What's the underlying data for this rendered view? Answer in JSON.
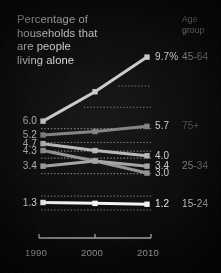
{
  "title_lines": [
    "Percentage of",
    "households that",
    "are people",
    "living alone"
  ],
  "header": {
    "age_group_line1": "Age",
    "age_group_line2": "group"
  },
  "axis": {
    "xticks": [
      "1990",
      "2000",
      "2010"
    ]
  },
  "chart_data": {
    "type": "line",
    "title": "Percentage of households that are people living alone",
    "xlabel": "",
    "ylabel": "",
    "x": [
      1990,
      2000,
      2010
    ],
    "xlim": [
      1990,
      2010
    ],
    "ylim": [
      0.0,
      10.4
    ],
    "grid": false,
    "legend_position": "right",
    "legend_title": "Age group",
    "series": [
      {
        "name": "45-64",
        "values": [
          6.0,
          7.7,
          9.7
        ],
        "start_label": "6.0",
        "end_label": "9.7%",
        "group_label": "45-64",
        "color": "#c8c8c8",
        "group_label_color": "#8a8a8a"
      },
      {
        "name": "75+",
        "values": [
          5.2,
          5.4,
          5.7
        ],
        "start_label": "5.2",
        "end_label": "5.7",
        "group_label": "75+",
        "color": "#7c7c7c",
        "group_label_color": "#585858"
      },
      {
        "name": "series-4.7",
        "values": [
          4.7,
          4.3,
          4.0
        ],
        "start_label": "4.7",
        "end_label": "4.0",
        "group_label": "",
        "color": "#b4b4b4",
        "group_label_color": "#585858"
      },
      {
        "name": "series-4.3",
        "values": [
          4.3,
          3.7,
          3.0
        ],
        "start_label": "4.3",
        "end_label": "3.0",
        "group_label": "",
        "color": "#8f8f8f",
        "group_label_color": "#585858"
      },
      {
        "name": "25-34",
        "values": [
          3.4,
          3.7,
          3.4
        ],
        "start_label": "3.4",
        "end_label": "3.4",
        "group_label": "25-34",
        "color": "#a0a0a0",
        "group_label_color": "#8a8a8a"
      },
      {
        "name": "15-24",
        "values": [
          1.3,
          1.25,
          1.2
        ],
        "start_label": "1.3",
        "end_label": "1.2",
        "group_label": "15-24",
        "color": "#f2f2f2",
        "group_label_color": "#d8d8d8"
      }
    ]
  }
}
